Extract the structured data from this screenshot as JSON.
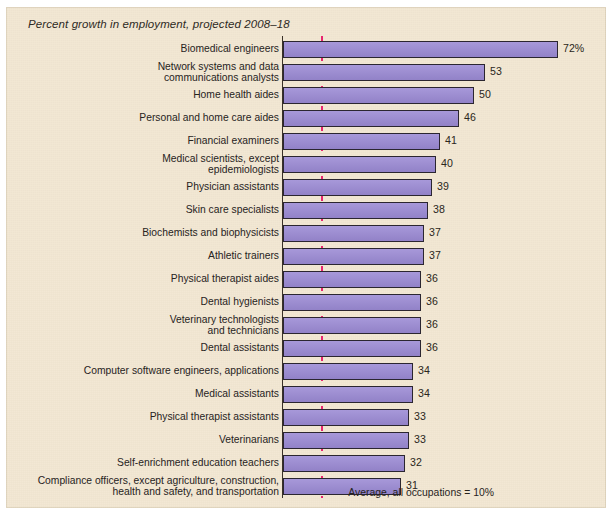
{
  "figure": {
    "title": "Percent growth in employment, projected 2008–18",
    "average_note": "Average, all occupations = 10%",
    "colors": {
      "panel_background": "#f2e7d2",
      "bar_fill": "#9b8ad4",
      "bar_outline": "#2b2630",
      "average_line": "#e8266f",
      "axis": "#3a3128",
      "text": "#27231d"
    }
  },
  "chart_data": {
    "type": "bar",
    "orientation": "horizontal",
    "title": "Percent growth in employment, projected 2008–18",
    "xlabel": "",
    "ylabel": "",
    "xlim": [
      0,
      75
    ],
    "grid": false,
    "legend": null,
    "value_suffix_first": "%",
    "annotations": [
      {
        "label": "Average, all occupations = 10%",
        "type": "reference-line",
        "value": 10,
        "style": "dashed",
        "color": "#e8266f"
      }
    ],
    "categories": [
      "Biomedical engineers",
      "Network systems and data\ncommunications analysts",
      "Home health aides",
      "Personal and home care aides",
      "Financial examiners",
      "Medical scientists, except\nepidemiologists",
      "Physician assistants",
      "Skin care specialists",
      "Biochemists and biophysicists",
      "Athletic trainers",
      "Physical therapist aides",
      "Dental hygienists",
      "Veterinary technologists\nand technicians",
      "Dental assistants",
      "Computer software engineers, applications",
      "Medical assistants",
      "Physical therapist assistants",
      "Veterinarians",
      "Self-enrichment education teachers",
      "Compliance officers, except agriculture, construction,\nhealth and safety, and transportation"
    ],
    "values": [
      72,
      53,
      50,
      46,
      41,
      40,
      39,
      38,
      37,
      37,
      36,
      36,
      36,
      36,
      34,
      34,
      33,
      33,
      32,
      31
    ],
    "value_labels": [
      "72%",
      "53",
      "50",
      "46",
      "41",
      "40",
      "39",
      "38",
      "37",
      "37",
      "36",
      "36",
      "36",
      "36",
      "34",
      "34",
      "33",
      "33",
      "32",
      "31"
    ]
  }
}
